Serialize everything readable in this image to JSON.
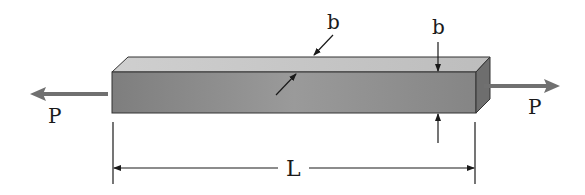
{
  "diagram": {
    "type": "axially loaded square bar",
    "labels": {
      "load_left": "P",
      "load_right": "P",
      "width_top": "b",
      "height_side": "b",
      "length": "L"
    },
    "colors": {
      "front_face": "#8a8a8a",
      "top_face": "#c8c8c8",
      "end_face": "#6e6e6e",
      "load_arrow": "#707070",
      "line": "#1a1a1a"
    }
  }
}
